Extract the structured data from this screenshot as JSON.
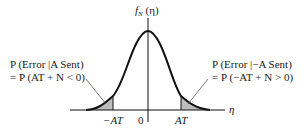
{
  "figure": {
    "y_axis_label": {
      "main": "f",
      "sub": "N",
      "arg": " (η)"
    },
    "x_axis_label": "η",
    "ticks": {
      "neg": "−AT",
      "zero": "0",
      "pos": "AT"
    },
    "left_annotation": {
      "line1": "P (Error |A Sent)",
      "line2": "= P (AT + N < 0)"
    },
    "right_annotation": {
      "line1": "P (Error |−A Sent)",
      "line2": "= P (−AT + N > 0)"
    },
    "colors": {
      "curve": "#111111",
      "axis": "#111111",
      "shade": "#bdbdbd",
      "pointer": "#555555"
    }
  }
}
